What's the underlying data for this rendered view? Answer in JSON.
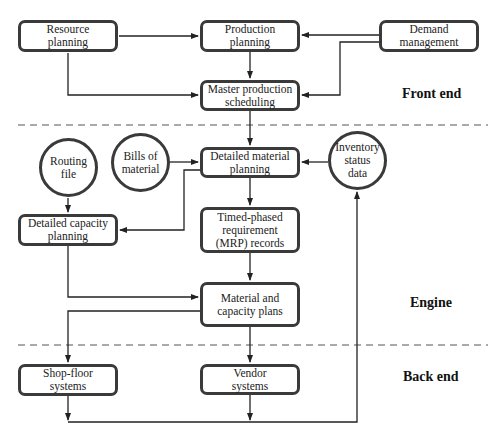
{
  "diagram": {
    "nodes": {
      "resource_planning": {
        "label": "Resource\nplanning",
        "shape": "rounded-rect"
      },
      "production_planning": {
        "label": "Production\nplanning",
        "shape": "rounded-rect"
      },
      "demand_management": {
        "label": "Demand\nmanagement",
        "shape": "rounded-rect"
      },
      "master_production_scheduling": {
        "label": "Master production\nscheduling",
        "shape": "rounded-rect"
      },
      "routing_file": {
        "label": "Routing\nfile",
        "shape": "circle"
      },
      "bills_of_material": {
        "label": "Bills of\nmaterial",
        "shape": "circle"
      },
      "detailed_material_planning": {
        "label": "Detailed material\nplanning",
        "shape": "rounded-rect"
      },
      "inventory_status_data": {
        "label": "Inventory\nstatus\ndata",
        "shape": "circle"
      },
      "detailed_capacity_planning": {
        "label": "Detailed capacity\nplanning",
        "shape": "rounded-rect"
      },
      "timed_phased_mrp": {
        "label": "Timed-phased\nrequirement\n(MRP) records",
        "shape": "rounded-rect"
      },
      "material_capacity_plans": {
        "label": "Material and\ncapacity plans",
        "shape": "rounded-rect"
      },
      "shop_floor_systems": {
        "label": "Shop-floor\nsystems",
        "shape": "rounded-rect"
      },
      "vendor_systems": {
        "label": "Vendor\nsystems",
        "shape": "rounded-rect"
      }
    },
    "sections": {
      "front_end": "Front end",
      "engine": "Engine",
      "back_end": "Back end"
    },
    "edges": [
      {
        "from": "Resource planning",
        "to": "Production planning"
      },
      {
        "from": "Resource planning",
        "to": "Master production scheduling"
      },
      {
        "from": "Demand management",
        "to": "Production planning"
      },
      {
        "from": "Demand management",
        "to": "Master production scheduling"
      },
      {
        "from": "Production planning",
        "to": "Master production scheduling"
      },
      {
        "from": "Master production scheduling",
        "to": "Detailed material planning"
      },
      {
        "from": "Bills of material",
        "to": "Detailed material planning"
      },
      {
        "from": "Inventory status data",
        "to": "Detailed material planning"
      },
      {
        "from": "Routing file",
        "to": "Detailed capacity planning"
      },
      {
        "from": "Detailed material planning",
        "to": "Detailed capacity planning"
      },
      {
        "from": "Detailed material planning",
        "to": "Timed-phased requirement (MRP) records"
      },
      {
        "from": "Timed-phased requirement (MRP) records",
        "to": "Material and capacity plans"
      },
      {
        "from": "Detailed capacity planning",
        "to": "Material and capacity plans"
      },
      {
        "from": "Material and capacity plans",
        "to": "Shop-floor systems"
      },
      {
        "from": "Material and capacity plans",
        "to": "Vendor systems"
      },
      {
        "from": "Shop-floor systems",
        "to": "Inventory status data"
      },
      {
        "from": "Vendor systems",
        "to": "Inventory status data"
      }
    ],
    "colors": {
      "stroke": "#3a3a3a",
      "line": "#222222",
      "dash": "#555555"
    }
  }
}
